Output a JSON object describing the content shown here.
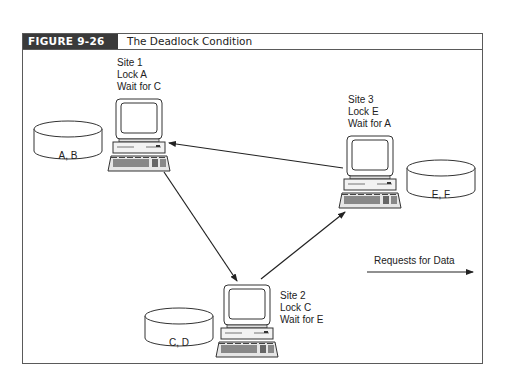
{
  "figure": {
    "label": "FIGURE 9-26",
    "title": "The Deadlock Condition"
  },
  "sites": [
    {
      "name": "Site 1",
      "lock": "Lock A",
      "wait": "Wait for C",
      "database": "A, B"
    },
    {
      "name": "Site 2",
      "lock": "Lock C",
      "wait": "Wait for E",
      "database": "C, D"
    },
    {
      "name": "Site 3",
      "lock": "Lock E",
      "wait": "Wait for A",
      "database": "E, F"
    }
  ],
  "edges": [
    {
      "from": "Site 3",
      "to": "Site 1"
    },
    {
      "from": "Site 1",
      "to": "Site 2"
    },
    {
      "from": "Site 2",
      "to": "Site 3"
    }
  ],
  "legend": {
    "label": "Requests for Data",
    "icon": "arrow-right-icon"
  },
  "colors": {
    "frame": "#5a5a5a",
    "label_bg": "#3a3a3a",
    "line": "#222222"
  }
}
